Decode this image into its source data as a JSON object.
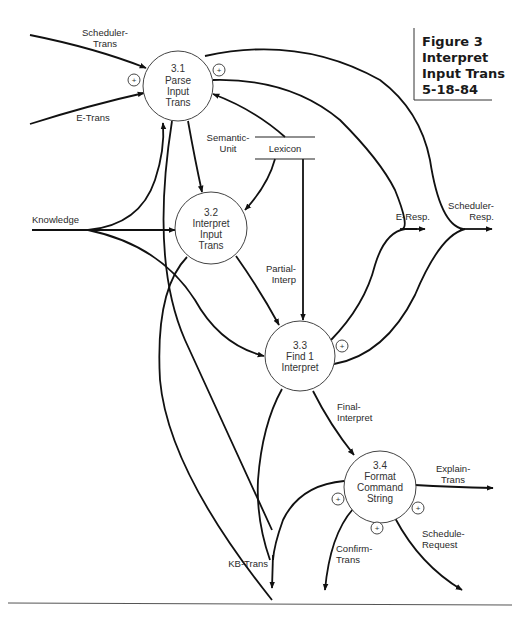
{
  "figure": {
    "title_lines": [
      "Figure 3",
      "Interpret",
      "Input Trans",
      "5-18-84"
    ]
  },
  "processes": [
    {
      "id": "3.1",
      "lines": [
        "Parse",
        "Input",
        "Trans"
      ]
    },
    {
      "id": "3.2",
      "lines": [
        "Interpret",
        "Input",
        "Trans"
      ]
    },
    {
      "id": "3.3",
      "lines": [
        "Find 1",
        "Interpret"
      ]
    },
    {
      "id": "3.4",
      "lines": [
        "Format",
        "Command",
        "String"
      ]
    }
  ],
  "data_store": {
    "label": "Lexicon"
  },
  "flows": {
    "scheduler_trans": [
      "Scheduler-",
      "Trans"
    ],
    "e_trans": "E-Trans",
    "knowledge": "Knowledge",
    "semantic_unit": [
      "Semantic-",
      "Unit"
    ],
    "partial_interp": [
      "Partial-",
      "Interp"
    ],
    "final_interpret": [
      "Final-",
      "Interpret"
    ],
    "e_resp": "E-Resp.",
    "scheduler_resp": [
      "Scheduler-",
      "Resp."
    ],
    "explain_trans": [
      "Explain-",
      "Trans"
    ],
    "schedule_request": [
      "Schedule-",
      "Request"
    ],
    "confirm_trans": [
      "Confirm-",
      "Trans"
    ],
    "kb_trans": "KB-Trans"
  },
  "markers": {
    "plus_symbol": "+"
  }
}
